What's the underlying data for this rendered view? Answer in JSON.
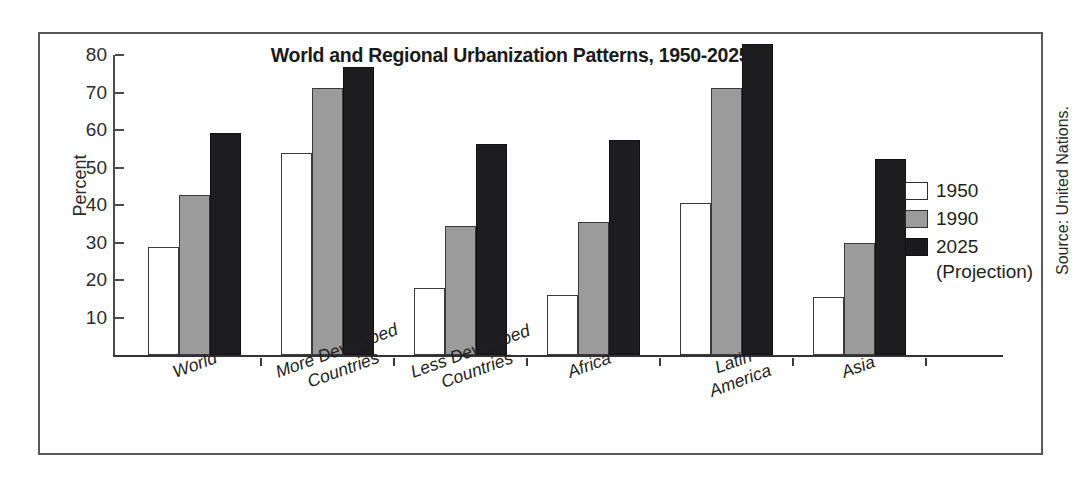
{
  "chart_data": {
    "type": "bar",
    "title": "World and Regional Urbanization Patterns, 1950-2025",
    "xlabel": "",
    "ylabel": "Percent",
    "ylim": [
      0,
      80
    ],
    "yticks": [
      10,
      20,
      30,
      40,
      50,
      60,
      70,
      80
    ],
    "grid": false,
    "legend_position": "right",
    "categories": [
      "World",
      "More Developed Countries",
      "Less Developed Countries",
      "Africa",
      "Latin America",
      "Asia"
    ],
    "series": [
      {
        "name": "1950",
        "color": "#ffffff",
        "values": [
          28.8,
          53.8,
          18.0,
          16.0,
          40.5,
          15.5
        ]
      },
      {
        "name": "1990",
        "color": "#9b9b9b",
        "values": [
          42.6,
          71.3,
          34.5,
          35.4,
          71.2,
          30.0
        ]
      },
      {
        "name": "2025",
        "color": "#1d1d1f",
        "values": [
          59.3,
          76.9,
          56.2,
          57.4,
          83.0,
          52.2
        ]
      }
    ],
    "annotations": {
      "source": "Source: United Nations.",
      "projection_note": "(Projection)"
    }
  },
  "legend": {
    "items": [
      {
        "label": "1950"
      },
      {
        "label": "1990"
      },
      {
        "label": "2025"
      }
    ],
    "projection_note": "(Projection)"
  },
  "axis": {
    "y_title": "Percent",
    "y_tick_labels": [
      "10",
      "20",
      "30",
      "40",
      "50",
      "60",
      "70",
      "80"
    ]
  },
  "source": {
    "text": "Source: United Nations."
  }
}
